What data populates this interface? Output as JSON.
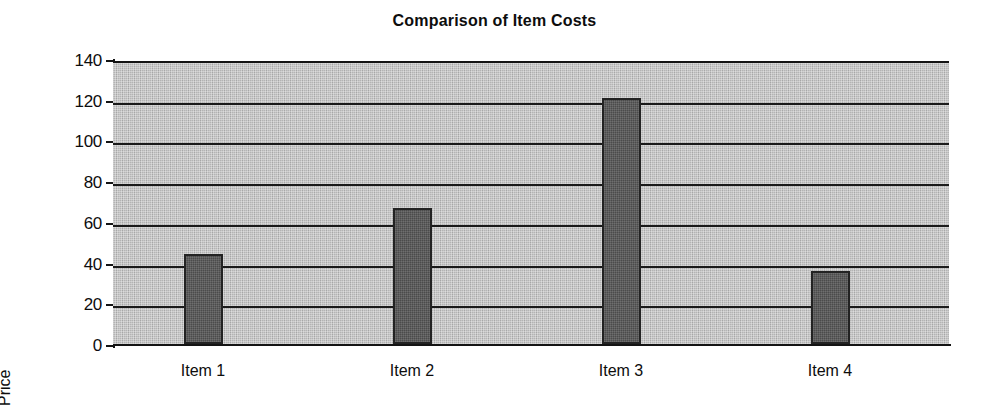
{
  "chart_data": {
    "type": "bar",
    "title": "Comparison of Item Costs",
    "xlabel": "",
    "ylabel": "Price",
    "categories": [
      "Item 1",
      "Item 2",
      "Item 3",
      "Item 4"
    ],
    "values": [
      44,
      67,
      121,
      36
    ],
    "ylim": [
      0,
      140
    ],
    "ytick_labels": [
      "140",
      "120",
      "100",
      "80",
      "60",
      "40",
      "20",
      "0"
    ],
    "ytick_values": [
      140,
      120,
      100,
      80,
      60,
      40,
      20,
      0
    ],
    "ytick_step": 20,
    "grid": "horizontal",
    "legend": "none",
    "plot_background_color": "#b4b4b4",
    "bar_color": "#4b4b4b",
    "axis_color": "#141414",
    "text_color": "#0d0d0d"
  },
  "axis": {
    "y_title": "Price"
  }
}
